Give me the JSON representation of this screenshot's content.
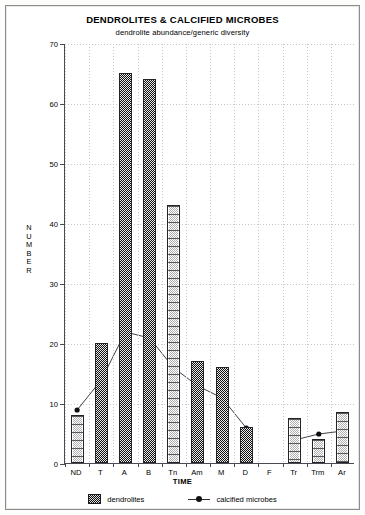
{
  "chart_data": {
    "type": "bar",
    "title": "DENDROLITES & CALCIFIED MICROBES",
    "subtitle": "dendrolite abundance/generic diversity",
    "xlabel": "TIME",
    "ylabel": "NUMBER",
    "ylim": [
      0,
      70
    ],
    "yticks": [
      0,
      10,
      20,
      30,
      40,
      50,
      60,
      70
    ],
    "grid": true,
    "legend_position": "bottom",
    "categories": [
      "ND",
      "T",
      "A",
      "B",
      "Tn",
      "Am",
      "M",
      "D",
      "F",
      "Tr",
      "Trm",
      "Ar"
    ],
    "series": [
      {
        "name": "dendrolites",
        "type": "bar",
        "values": [
          8,
          20,
          65,
          64,
          43,
          17,
          16,
          6,
          0,
          7.5,
          4,
          8.5
        ],
        "styles": [
          "hollow",
          "fill",
          "fill",
          "fill",
          "hollow",
          "fill",
          "fill",
          "fill",
          "none",
          "hollow",
          "hollow",
          "hollow"
        ]
      },
      {
        "name": "calcified microbes",
        "type": "line",
        "values": [
          9,
          14,
          22,
          21,
          16,
          13,
          11,
          6,
          null,
          4,
          5,
          5.5
        ]
      }
    ]
  },
  "chart": {
    "title": "DENDROLITES & CALCIFIED MICROBES",
    "subtitle": "dendrolite abundance/generic diversity",
    "ylabel_chars": [
      "N",
      "U",
      "M",
      "B",
      "E",
      "R"
    ],
    "xlabel": "TIME",
    "ytick_labels": [
      "70",
      "60",
      "50",
      "40",
      "30",
      "20",
      "10",
      "0"
    ],
    "xtick_labels": [
      "ND",
      "T",
      "A",
      "B",
      "Tn",
      "Am",
      "M",
      "D",
      "F",
      "Tr",
      "Trm",
      "Ar"
    ],
    "legend": [
      {
        "label": "dendrolites",
        "marker": "bar-swatch-icon",
        "color": "#1d1d22"
      },
      {
        "label": "calcified microbes",
        "marker": "line-point-icon",
        "color": "#2b2b33"
      }
    ],
    "colors": {
      "axis": "#4a4a52",
      "grid": "#c7c7c7",
      "bar_dark": "#2a2a2a",
      "bar_light": "#ffffff",
      "line": "#2b2b33"
    }
  }
}
